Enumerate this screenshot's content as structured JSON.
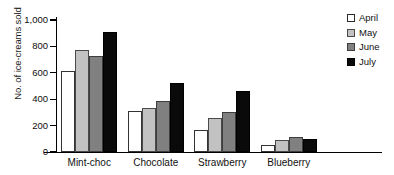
{
  "chart_data": {
    "type": "bar",
    "title": "",
    "xlabel": "",
    "ylabel": "No. of ice-creams sold",
    "categories": [
      "Mint-choc",
      "Chocolate",
      "Strawberry",
      "Blueberry"
    ],
    "series": [
      {
        "name": "April",
        "color": "#ffffff",
        "values": [
          610,
          310,
          165,
          55
        ]
      },
      {
        "name": "May",
        "color": "#c2c2c2",
        "values": [
          770,
          330,
          255,
          90
        ]
      },
      {
        "name": "June",
        "color": "#808080",
        "values": [
          730,
          385,
          305,
          115
        ]
      },
      {
        "name": "July",
        "color": "#0a0a0a",
        "values": [
          910,
          525,
          465,
          95
        ]
      }
    ],
    "ylim": [
      0,
      1000
    ],
    "ytick_labels": [
      "0",
      "200",
      "400",
      "600",
      "800",
      "1,000"
    ],
    "ytick_values": [
      0,
      200,
      400,
      600,
      800,
      1000
    ],
    "grid": false,
    "legend_position": "right"
  }
}
